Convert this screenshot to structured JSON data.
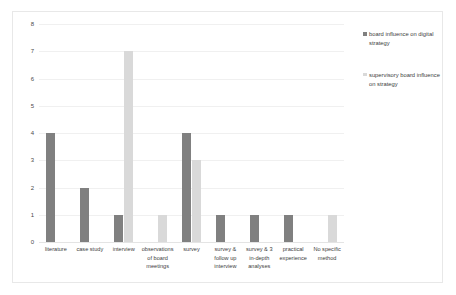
{
  "chart_data": {
    "type": "bar",
    "title": "",
    "xlabel": "",
    "ylabel": "",
    "ylim": [
      0,
      8
    ],
    "yticks": [
      "0",
      "1",
      "2",
      "3",
      "4",
      "5",
      "6",
      "7",
      "8"
    ],
    "grid": true,
    "legend_position": "right",
    "categories": [
      "literature",
      "case study",
      "interview",
      "observations of board meetings",
      "survey",
      "survey & follow up interview",
      "survey & 3 in-depth analyses",
      "practical experience",
      "No specific method"
    ],
    "series": [
      {
        "name": "board influence on digital strategy",
        "color": "#808080",
        "values": [
          4,
          2,
          1,
          0,
          4,
          1,
          1,
          1,
          0
        ]
      },
      {
        "name": "supervisory board influence on strategy",
        "color": "#d9d9d9",
        "values": [
          0,
          0,
          7,
          1,
          3,
          0,
          0,
          0,
          1
        ]
      }
    ]
  }
}
